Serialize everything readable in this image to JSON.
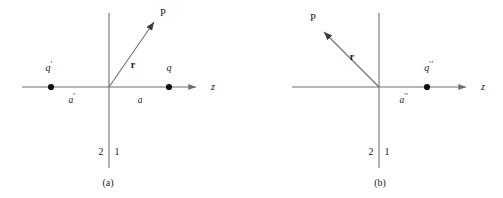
{
  "figure": {
    "type": "physics-diagram",
    "stroke_color": "#6f6f6f",
    "text_color": "#1a1a1a",
    "background": "#ffffff",
    "panels": [
      {
        "id": "a",
        "caption": "(a)",
        "origin": {
          "x": 109,
          "y": 87
        },
        "z_axis": {
          "x1": 22,
          "x2": 200,
          "y": 87,
          "label": "z",
          "arrow": "right"
        },
        "vertical_axis": {
          "x": 109,
          "y1": 13,
          "y2": 168
        },
        "vector": {
          "label": "r",
          "from": {
            "x": 109,
            "y": 87
          },
          "to": {
            "x": 157,
            "y": 18
          },
          "label_pos": {
            "x": 133,
            "y": 65
          },
          "direction": "up-right"
        },
        "field_point": {
          "label": "P",
          "x": 163,
          "y": 13
        },
        "charges": [
          {
            "label": "q",
            "prime": "′",
            "x": 51,
            "y": 87,
            "label_pos": {
              "x": 49,
              "y": 67
            }
          },
          {
            "label": "q",
            "prime": "",
            "x": 169,
            "y": 87,
            "label_pos": {
              "x": 169,
              "y": 67
            }
          }
        ],
        "distances": [
          {
            "label": "a",
            "prime": "′",
            "x": 72,
            "y": 99
          },
          {
            "label": "a",
            "prime": "",
            "x": 140,
            "y": 99
          }
        ],
        "regions": [
          {
            "label": "2",
            "x": 101,
            "y": 152
          },
          {
            "label": "1",
            "x": 117,
            "y": 152
          }
        ]
      },
      {
        "id": "b",
        "caption": "(b)",
        "origin": {
          "x": 127,
          "y": 87
        },
        "z_axis": {
          "x1": 40,
          "x2": 218,
          "y": 87,
          "label": "z",
          "arrow": "right"
        },
        "vertical_axis": {
          "x": 127,
          "y1": 13,
          "y2": 168
        },
        "vector": {
          "label": "r",
          "from": {
            "x": 127,
            "y": 87
          },
          "to": {
            "x": 69,
            "y": 29
          },
          "label_pos": {
            "x": 100,
            "y": 57
          },
          "direction": "up-left"
        },
        "field_point": {
          "label": "P",
          "x": 61,
          "y": 18
        },
        "charges": [
          {
            "label": "q",
            "prime": "′′",
            "x": 175,
            "y": 87,
            "label_pos": {
              "x": 177,
              "y": 67
            }
          }
        ],
        "distances": [
          {
            "label": "a",
            "prime": "′′",
            "x": 152,
            "y": 99
          }
        ],
        "regions": [
          {
            "label": "2",
            "x": 119,
            "y": 152
          },
          {
            "label": "1",
            "x": 135,
            "y": 152
          }
        ]
      }
    ]
  }
}
